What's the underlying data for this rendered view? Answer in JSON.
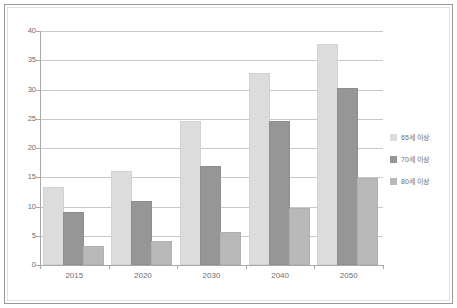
{
  "chart_data": {
    "type": "bar",
    "title": "",
    "subtitle": "",
    "xlabel": "",
    "ylabel": "",
    "categories": [
      "2015",
      "2020",
      "2030",
      "2040",
      "2050"
    ],
    "series": [
      {
        "name": "65세 이상",
        "color": "#dcdcdc",
        "values": [
          13.0,
          15.7,
          24.3,
          32.5,
          37.5
        ]
      },
      {
        "name": "70세 이상",
        "color": "#969696",
        "values": [
          8.8,
          10.6,
          16.6,
          24.3,
          30.0
        ]
      },
      {
        "name": "80세 이상",
        "color": "#b9b9b9",
        "values": [
          2.9,
          3.7,
          5.3,
          9.4,
          14.6
        ]
      }
    ],
    "ylim": [
      0,
      40
    ],
    "yticks": [
      0,
      5,
      10,
      15,
      20,
      25,
      30,
      35,
      40
    ],
    "ytick_labels": [
      "0",
      "5",
      "10",
      "15",
      "20",
      "25",
      "30",
      "35",
      "40"
    ],
    "grid": true,
    "legend_position": "right"
  }
}
